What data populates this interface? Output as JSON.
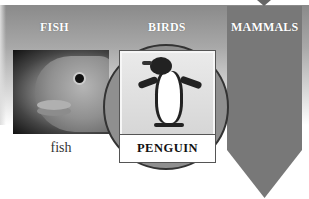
{
  "columns": [
    {
      "label": "FISH"
    },
    {
      "label": "BIRDS"
    },
    {
      "label": "MAMMALS"
    }
  ],
  "fish": {
    "caption": "fish",
    "image": "fish-face-photo"
  },
  "bird": {
    "card_label": "PENGUIN",
    "image": "penguin-photo"
  },
  "colors": {
    "mammals_column": "#787878",
    "circle": "#8f8f8f",
    "header_gradient_top": "#8a8a8a",
    "text_label": "#ffffff"
  }
}
